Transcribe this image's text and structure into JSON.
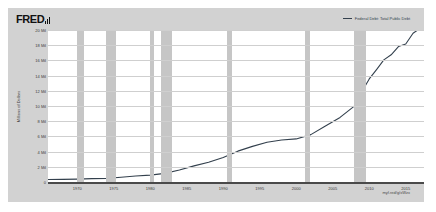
{
  "brand": {
    "name": "FRED",
    "logo_icon": "bar-chart-icon"
  },
  "legend": {
    "label": "Federal Debt: Total Public Debt",
    "color": "#33404d"
  },
  "source_note": "myf.red/g/xWzx",
  "axis": {
    "ylabel": "Millions of Dollars"
  },
  "chart_data": {
    "type": "line",
    "title": "",
    "subtitle": "",
    "xlabel": "",
    "ylabel": "Millions of Dollars",
    "xlim": [
      1966,
      2017.5
    ],
    "ylim": [
      0,
      20000000
    ],
    "grid": true,
    "legend_position": "top-right",
    "ytick_labels": [
      "20 Mil",
      "18 Mil",
      "16 Mil",
      "14 Mil",
      "12 Mil",
      "10 Mil",
      "8 Mil",
      "6 Mil",
      "4 Mil",
      "2 Mil",
      "0"
    ],
    "ytick_values": [
      20000000,
      18000000,
      16000000,
      14000000,
      12000000,
      10000000,
      8000000,
      6000000,
      4000000,
      2000000,
      0
    ],
    "xtick_labels": [
      "1970",
      "1975",
      "1980",
      "1985",
      "1990",
      "1995",
      "2000",
      "2005",
      "2010",
      "2015"
    ],
    "xtick_values": [
      1970,
      1975,
      1980,
      1985,
      1990,
      1995,
      2000,
      2005,
      2010,
      2015
    ],
    "series": [
      {
        "name": "Federal Debt: Total Public Debt",
        "color": "#33404d",
        "units": "Millions of Dollars",
        "x": [
          1966,
          1968,
          1970,
          1972,
          1974,
          1976,
          1978,
          1980,
          1982,
          1984,
          1986,
          1988,
          1990,
          1992,
          1994,
          1996,
          1998,
          2000,
          2002,
          2004,
          2006,
          2008,
          2009,
          2010,
          2011,
          2012,
          2013,
          2014,
          2015,
          2016,
          2017,
          2017.5
        ],
        "values": [
          320000,
          350000,
          380000,
          440000,
          480000,
          630000,
          780000,
          910000,
          1140000,
          1570000,
          2120000,
          2600000,
          3230000,
          4060000,
          4690000,
          5220000,
          5530000,
          5670000,
          6230000,
          7380000,
          8500000,
          10020000,
          11900000,
          13560000,
          14790000,
          16070000,
          16740000,
          17820000,
          18150000,
          19570000,
          20240000,
          20490000
        ]
      }
    ],
    "recession_bands": [
      {
        "start": 1969.92,
        "end": 1970.92
      },
      {
        "start": 1973.92,
        "end": 1975.25
      },
      {
        "start": 1980.0,
        "end": 1980.5
      },
      {
        "start": 1981.5,
        "end": 1982.92
      },
      {
        "start": 1990.5,
        "end": 1991.25
      },
      {
        "start": 2001.17,
        "end": 2001.92
      },
      {
        "start": 2007.92,
        "end": 2009.5
      }
    ],
    "recession_band_color": "#c6c6c6"
  }
}
